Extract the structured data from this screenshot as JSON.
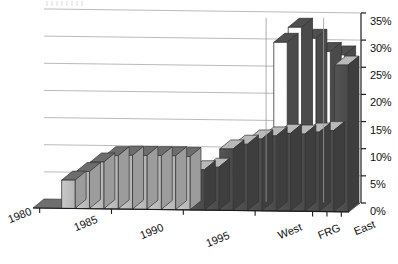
{
  "chart_data": {
    "type": "bar",
    "title": "",
    "xlabel": "",
    "ylabel": "",
    "ylim": [
      0,
      35
    ],
    "ytick_labels": [
      "35%",
      "30%",
      "25%",
      "20%",
      "15%",
      "10%",
      "5%",
      "0%"
    ],
    "ytick_values": [
      35,
      30,
      25,
      20,
      15,
      10,
      5,
      0
    ],
    "grid": true,
    "legend": "none",
    "x_tick_labels": [
      "1980",
      "1985",
      "1990",
      "1995",
      "West",
      "FRG",
      "East"
    ],
    "categories": [
      "1980",
      "1981",
      "1982",
      "1983",
      "1984",
      "1985",
      "1986",
      "1987",
      "1988",
      "1989",
      "1990",
      "1991",
      "1992",
      "1993",
      "1994",
      "1995",
      "1996",
      "1997",
      "1998",
      "West",
      "FRG",
      "East"
    ],
    "series": [
      {
        "name": "front",
        "style": "solid-front",
        "values": [
          0,
          0,
          5.2,
          6.8,
          8.6,
          9.8,
          9.9,
          9.9,
          9.9,
          9.9,
          9.8,
          7.4,
          7.9,
          11.3,
          12.2,
          13.2,
          13.8,
          14.3,
          14.2,
          14.6,
          14.9,
          27.0
        ]
      },
      {
        "name": "back",
        "style": "tall-white",
        "values": [
          0,
          0,
          0,
          0,
          0,
          0,
          0,
          0,
          0,
          0,
          0,
          0,
          0,
          0,
          0,
          0,
          29.4,
          32.2,
          30.2,
          27.8,
          27.2,
          0
        ]
      }
    ],
    "annotations": {
      "vertical_gridline_years": [
        "1995",
        "West"
      ]
    }
  },
  "axis": {
    "y_labels": [
      {
        "text": "35%",
        "y": 15
      },
      {
        "text": "30%",
        "y": 42
      },
      {
        "text": "25%",
        "y": 69
      },
      {
        "text": "20%",
        "y": 96
      },
      {
        "text": "15%",
        "y": 124
      },
      {
        "text": "10%",
        "y": 151
      },
      {
        "text": "5%",
        "y": 178
      },
      {
        "text": "0%",
        "y": 205
      }
    ],
    "x_labels": [
      {
        "text": "1980",
        "x": 6,
        "y": 214
      },
      {
        "text": "1985",
        "x": 72,
        "y": 222
      },
      {
        "text": "1990",
        "x": 138,
        "y": 230
      },
      {
        "text": "1995",
        "x": 204,
        "y": 238
      },
      {
        "text": "West",
        "x": 276,
        "y": 230
      },
      {
        "text": "FRG",
        "x": 316,
        "y": 230
      },
      {
        "text": "East",
        "x": 352,
        "y": 226
      }
    ]
  }
}
